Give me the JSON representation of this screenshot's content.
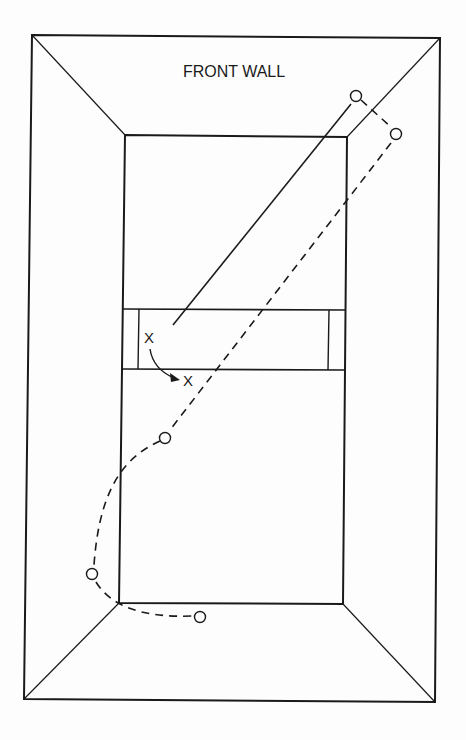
{
  "diagram": {
    "title_label": "FRONT WALL",
    "markers": {
      "player_start": "X",
      "player_end": "X"
    },
    "colors": {
      "line": "#1a1a1a",
      "background": "#fdfdfd"
    },
    "elements": [
      {
        "type": "court-outline",
        "description": "outer wall perimeter"
      },
      {
        "type": "front-wall",
        "label": "FRONT WALL"
      },
      {
        "type": "service-zone",
        "description": "service box with short lines"
      },
      {
        "type": "shot-path",
        "style": "solid",
        "description": "ball hit toward front right corner"
      },
      {
        "type": "ball-rebound-path",
        "style": "dashed",
        "bounces": 5
      },
      {
        "type": "player-movement",
        "description": "curved arrow from X to X"
      }
    ]
  }
}
